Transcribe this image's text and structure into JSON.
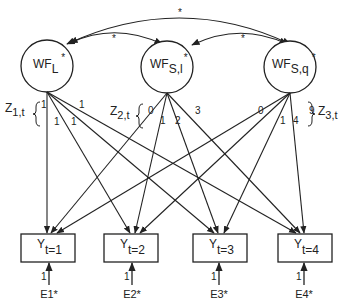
{
  "latent_factors": [
    {
      "id": "WFL",
      "main": "WF",
      "sub": "L",
      "star": "*"
    },
    {
      "id": "WFSl",
      "main": "WF",
      "sub": "S,l",
      "star": "*"
    },
    {
      "id": "WFSq",
      "main": "WF",
      "sub": "S,q",
      "star": "*"
    }
  ],
  "covariances": [
    {
      "from": "WFL",
      "to": "WFSq",
      "label": "*"
    },
    {
      "from": "WFL",
      "to": "WFSl",
      "label": "*"
    },
    {
      "from": "WFSl",
      "to": "WFSq",
      "label": "*"
    }
  ],
  "loading_groups": [
    {
      "main": "Z",
      "sub": "1,t",
      "loadings": [
        "1",
        "1",
        "1",
        "1"
      ]
    },
    {
      "main": "Z",
      "sub": "2,t",
      "loadings": [
        "0",
        "1",
        "2",
        "3"
      ]
    },
    {
      "main": "Z",
      "sub": "3,t",
      "loadings": [
        "0",
        "1",
        "4",
        "9"
      ]
    }
  ],
  "observed": [
    {
      "main": "Y",
      "sub": "t=1"
    },
    {
      "main": "Y",
      "sub": "t=2"
    },
    {
      "main": "Y",
      "sub": "t=3"
    },
    {
      "main": "Y",
      "sub": "t=4"
    }
  ],
  "errors": [
    {
      "label": "E1*",
      "path": "1"
    },
    {
      "label": "E2*",
      "path": "1"
    },
    {
      "label": "E3*",
      "path": "1"
    },
    {
      "label": "E4*",
      "path": "1"
    }
  ]
}
